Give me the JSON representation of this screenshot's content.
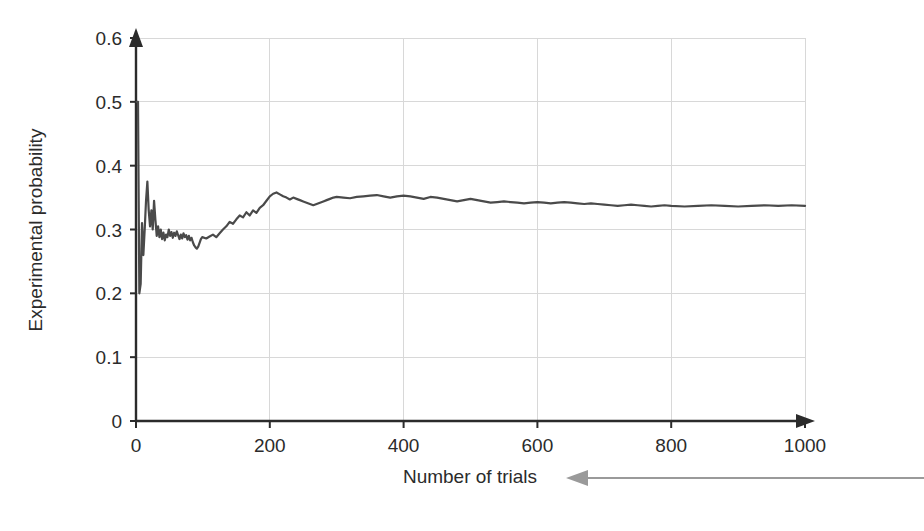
{
  "chart_data": {
    "type": "line",
    "title": "",
    "subtitle": "",
    "xlabel": "Number of trials",
    "ylabel": "Experimental probability",
    "xlim": [
      0,
      1000
    ],
    "ylim": [
      0,
      0.6
    ],
    "x_ticks": [
      0,
      200,
      400,
      600,
      800,
      1000
    ],
    "x_tick_labels": [
      "0",
      "200",
      "400",
      "600",
      "800",
      "1000"
    ],
    "y_ticks": [
      0,
      0.1,
      0.2,
      0.3,
      0.4,
      0.5,
      0.6
    ],
    "y_tick_labels": [
      "0",
      "0.1",
      "0.2",
      "0.3",
      "0.4",
      "0.5",
      "0.6"
    ],
    "grid": true,
    "grid_axis": "both",
    "legend": false,
    "legend_position": "none",
    "line_color": "#4a4a4a",
    "series": [
      {
        "name": "Experimental probability",
        "x": [
          1,
          3,
          5,
          7,
          9,
          11,
          13,
          15,
          17,
          19,
          21,
          23,
          25,
          27,
          29,
          31,
          33,
          35,
          37,
          39,
          41,
          43,
          45,
          47,
          49,
          51,
          53,
          55,
          57,
          59,
          61,
          63,
          65,
          67,
          69,
          71,
          73,
          75,
          77,
          79,
          81,
          83,
          85,
          87,
          89,
          91,
          93,
          95,
          97,
          99,
          105,
          110,
          115,
          120,
          125,
          130,
          135,
          140,
          145,
          150,
          155,
          160,
          165,
          170,
          175,
          180,
          185,
          190,
          195,
          200,
          205,
          210,
          215,
          220,
          225,
          230,
          235,
          240,
          245,
          250,
          255,
          260,
          265,
          270,
          275,
          280,
          285,
          290,
          295,
          300,
          310,
          320,
          330,
          340,
          350,
          360,
          370,
          380,
          390,
          400,
          410,
          420,
          430,
          440,
          450,
          460,
          470,
          480,
          490,
          500,
          510,
          520,
          530,
          540,
          550,
          560,
          570,
          580,
          590,
          600,
          610,
          620,
          630,
          640,
          650,
          660,
          670,
          680,
          690,
          700,
          710,
          720,
          730,
          740,
          750,
          760,
          770,
          780,
          790,
          800,
          820,
          840,
          860,
          880,
          900,
          920,
          940,
          960,
          980,
          1000
        ],
        "y": [
          0.5,
          0.5,
          0.2,
          0.215,
          0.31,
          0.26,
          0.3,
          0.345,
          0.375,
          0.33,
          0.305,
          0.33,
          0.3,
          0.345,
          0.315,
          0.29,
          0.305,
          0.288,
          0.3,
          0.285,
          0.295,
          0.283,
          0.292,
          0.288,
          0.3,
          0.29,
          0.296,
          0.287,
          0.295,
          0.29,
          0.297,
          0.291,
          0.285,
          0.292,
          0.286,
          0.294,
          0.288,
          0.291,
          0.284,
          0.29,
          0.283,
          0.287,
          0.28,
          0.275,
          0.272,
          0.27,
          0.273,
          0.279,
          0.285,
          0.288,
          0.286,
          0.289,
          0.292,
          0.288,
          0.294,
          0.3,
          0.305,
          0.312,
          0.309,
          0.316,
          0.322,
          0.319,
          0.327,
          0.322,
          0.33,
          0.326,
          0.334,
          0.338,
          0.345,
          0.352,
          0.356,
          0.358,
          0.355,
          0.352,
          0.35,
          0.347,
          0.35,
          0.348,
          0.346,
          0.344,
          0.342,
          0.34,
          0.338,
          0.34,
          0.342,
          0.344,
          0.346,
          0.348,
          0.35,
          0.351,
          0.35,
          0.349,
          0.351,
          0.352,
          0.353,
          0.354,
          0.352,
          0.35,
          0.352,
          0.353,
          0.352,
          0.35,
          0.348,
          0.351,
          0.35,
          0.348,
          0.346,
          0.344,
          0.346,
          0.348,
          0.346,
          0.344,
          0.342,
          0.343,
          0.344,
          0.343,
          0.342,
          0.341,
          0.342,
          0.343,
          0.342,
          0.341,
          0.342,
          0.343,
          0.342,
          0.341,
          0.34,
          0.341,
          0.34,
          0.339,
          0.338,
          0.337,
          0.338,
          0.339,
          0.338,
          0.337,
          0.336,
          0.337,
          0.338,
          0.337,
          0.336,
          0.337,
          0.338,
          0.337,
          0.336,
          0.337,
          0.338,
          0.337,
          0.338,
          0.337
        ],
        "color": "#4a4a4a"
      }
    ],
    "annotations": [
      {
        "type": "leader-arrow",
        "target": "Number of trials",
        "direction": "left",
        "color": "#9a9a9a"
      }
    ]
  }
}
